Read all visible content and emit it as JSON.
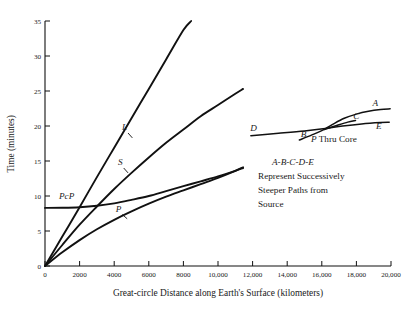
{
  "chart_data": {
    "type": "line",
    "title": "",
    "xlabel": "Great-circle Distance along Earth's Surface (kilometers)",
    "ylabel": "Time (minutes)",
    "xlim": [
      0,
      20000
    ],
    "ylim": [
      0,
      35
    ],
    "grid": false,
    "legend": "inline-curve-labels",
    "xticks": [
      0,
      2000,
      4000,
      6000,
      8000,
      10000,
      12000,
      14000,
      16000,
      18000,
      20000
    ],
    "xticklabels": [
      "0",
      "2000",
      "4000",
      "6000",
      "8000",
      "10,000",
      "12,000",
      "14,000",
      "16,000",
      "18,000",
      "20,000"
    ],
    "yticks": [
      0,
      5,
      10,
      15,
      20,
      25,
      30,
      35
    ],
    "yticklabels": [
      "0",
      "5",
      "10",
      "15",
      "20",
      "25",
      "30",
      "35"
    ],
    "series": [
      {
        "name": "L",
        "label": "L",
        "label_x": 4600,
        "label_y": 19.4,
        "points": [
          [
            0,
            0
          ],
          [
            1000,
            4.2
          ],
          [
            2000,
            8.4
          ],
          [
            3000,
            12.7
          ],
          [
            4000,
            16.9
          ],
          [
            5000,
            21.1
          ],
          [
            6000,
            25.3
          ],
          [
            7000,
            29.5
          ],
          [
            8000,
            33.7
          ],
          [
            8450,
            35.0
          ]
        ]
      },
      {
        "name": "S",
        "label": "S",
        "label_x": 4350,
        "label_y": 14.4,
        "points": [
          [
            0,
            0
          ],
          [
            1000,
            3.0
          ],
          [
            2000,
            5.9
          ],
          [
            3000,
            8.5
          ],
          [
            4000,
            11.0
          ],
          [
            5000,
            13.3
          ],
          [
            6000,
            15.5
          ],
          [
            7000,
            17.6
          ],
          [
            8000,
            19.5
          ],
          [
            9000,
            21.4
          ],
          [
            10000,
            23.0
          ],
          [
            11000,
            24.6
          ],
          [
            11450,
            25.3
          ]
        ]
      },
      {
        "name": "PcP",
        "label": "PcP",
        "label_x": 1250,
        "label_y": 9.6,
        "points": [
          [
            0,
            8.3
          ],
          [
            1000,
            8.32
          ],
          [
            2000,
            8.4
          ],
          [
            3000,
            8.6
          ],
          [
            4000,
            8.95
          ],
          [
            5000,
            9.45
          ],
          [
            6000,
            10.0
          ],
          [
            7000,
            10.7
          ],
          [
            8000,
            11.4
          ],
          [
            9000,
            12.1
          ],
          [
            10000,
            12.8
          ],
          [
            11000,
            13.6
          ],
          [
            11450,
            14.0
          ]
        ]
      },
      {
        "name": "P",
        "label": "P",
        "label_x": 4250,
        "label_y": 7.7,
        "points": [
          [
            0,
            0
          ],
          [
            1000,
            1.95
          ],
          [
            2000,
            3.7
          ],
          [
            3000,
            5.25
          ],
          [
            4000,
            6.6
          ],
          [
            5000,
            7.8
          ],
          [
            6000,
            8.9
          ],
          [
            7000,
            9.9
          ],
          [
            8000,
            10.8
          ],
          [
            9000,
            11.7
          ],
          [
            10000,
            12.6
          ],
          [
            11000,
            13.6
          ],
          [
            11450,
            14.1
          ]
        ]
      }
    ]
  },
  "inset": {
    "caption_title": "P Thru Core",
    "caption_title_italic": "P",
    "caption_title_rest": " Thru Core",
    "caption_lines": [
      "A-B-C-D-E",
      "Represent Successively",
      "Steeper Paths from",
      "Source"
    ],
    "branch_labels": [
      {
        "name": "D",
        "x": 12050,
        "y": 19.3
      },
      {
        "name": "B",
        "x": 14950,
        "y": 18.4
      },
      {
        "name": "A",
        "x": 19100,
        "y": 22.9
      },
      {
        "name": "C",
        "x": 18000,
        "y": 21.0
      },
      {
        "name": "E",
        "x": 19300,
        "y": 19.6
      }
    ],
    "curves": [
      {
        "name": "D-E",
        "points": [
          [
            11900,
            18.6
          ],
          [
            13500,
            18.95
          ],
          [
            15000,
            19.3
          ],
          [
            16200,
            19.65
          ],
          [
            17200,
            20.0
          ],
          [
            18300,
            20.3
          ],
          [
            19400,
            20.5
          ],
          [
            19900,
            20.55
          ]
        ]
      },
      {
        "name": "B-A",
        "points": [
          [
            14700,
            18.0
          ],
          [
            15400,
            18.7
          ],
          [
            16000,
            19.35
          ],
          [
            16600,
            20.2
          ],
          [
            17300,
            21.1
          ],
          [
            18000,
            21.7
          ],
          [
            18700,
            22.1
          ],
          [
            19400,
            22.35
          ],
          [
            19950,
            22.45
          ]
        ]
      },
      {
        "name": "C-branch",
        "points": [
          [
            16150,
            19.5
          ],
          [
            16900,
            20.1
          ],
          [
            17500,
            20.55
          ],
          [
            17950,
            20.8
          ]
        ]
      }
    ]
  }
}
